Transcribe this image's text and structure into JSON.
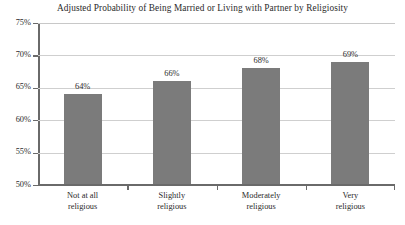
{
  "chart_data": {
    "type": "bar",
    "title": "Adjusted Probability of Being Married or Living with Partner by Religiosity",
    "xlabel": "",
    "ylabel": "",
    "categories": [
      "Not at all religious",
      "Slightly religious",
      "Moderately religious",
      "Very religious"
    ],
    "category_lines": [
      [
        "Not at all",
        "religious"
      ],
      [
        "Slightly",
        "religious"
      ],
      [
        "Moderately",
        "religious"
      ],
      [
        "Very",
        "religious"
      ]
    ],
    "values": [
      64,
      66,
      68,
      69
    ],
    "value_labels": [
      "64%",
      "66%",
      "68%",
      "69%"
    ],
    "ylim": [
      50,
      75
    ],
    "ytick_values": [
      75,
      70,
      65,
      60,
      55,
      50
    ],
    "ytick_labels": [
      "75%",
      "70%",
      "65%",
      "60%",
      "55%",
      "50%"
    ],
    "grid": true,
    "legend": false,
    "legend_position": "none",
    "bar_color": "#7b7b7b",
    "axis_color": "#6a6a6a",
    "gridline_color": "#cfcfcf",
    "background_color": "#ffffff",
    "text_color": "#2b2b2b"
  }
}
